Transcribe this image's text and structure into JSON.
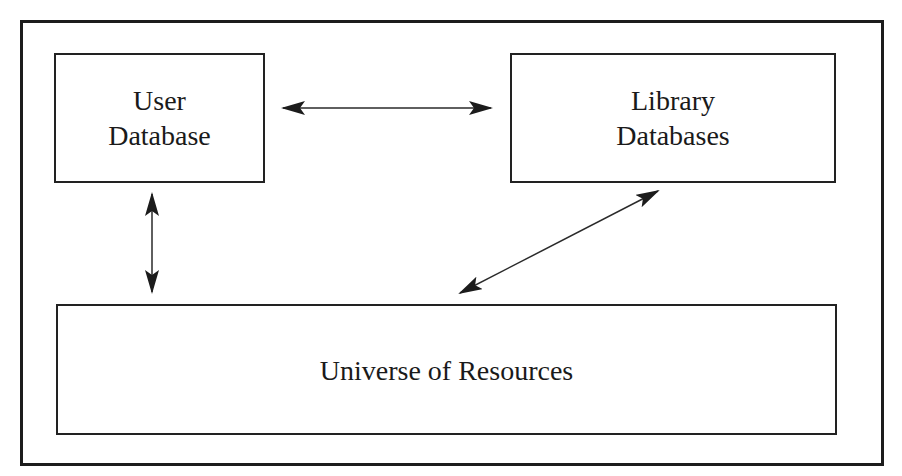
{
  "diagram": {
    "nodes": [
      {
        "id": "user-database",
        "lines": [
          "User",
          "Database"
        ]
      },
      {
        "id": "library-databases",
        "lines": [
          "Library",
          "Databases"
        ]
      },
      {
        "id": "universe-of-resources",
        "lines": [
          "Universe of Resources"
        ]
      }
    ],
    "edges": [
      {
        "from": "user-database",
        "to": "library-databases",
        "type": "bidirectional"
      },
      {
        "from": "user-database",
        "to": "universe-of-resources",
        "type": "bidirectional"
      },
      {
        "from": "library-databases",
        "to": "universe-of-resources",
        "type": "bidirectional"
      }
    ],
    "colors": {
      "stroke": "#1c1c1c",
      "background": "#ffffff",
      "text": "#1a1a1a"
    }
  }
}
